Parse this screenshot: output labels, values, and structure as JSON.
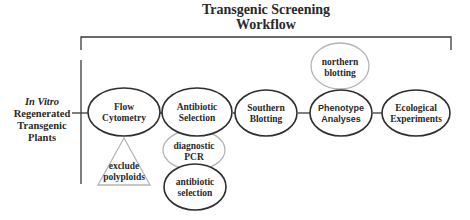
{
  "title": {
    "line1": "Transgenic Screening",
    "line2": "Workflow"
  },
  "source": {
    "line1": "In Vitro",
    "line2": "Regenerated",
    "line3": "Transgenic",
    "line4": "Plants"
  },
  "main_steps": [
    {
      "line1": "Flow",
      "line2": "Cytometry",
      "shape": "ellipse",
      "style": "dark"
    },
    {
      "line1": "Antibiotic",
      "line2": "Selection",
      "shape": "ellipse",
      "style": "dark"
    },
    {
      "line1": "Southern",
      "line2": "Blotting",
      "shape": "ellipse",
      "style": "dark"
    },
    {
      "line1": "Phenotype",
      "line2": "Analyses",
      "shape": "ellipse",
      "style": "dark"
    },
    {
      "line1": "Ecological",
      "line2": "Experiments",
      "shape": "ellipse",
      "style": "dark"
    }
  ],
  "sub_steps": {
    "exclude_polyploids": {
      "line1": "exclude",
      "line2": "polyploids",
      "shape": "triangle",
      "style": "light",
      "parent": "Flow Cytometry"
    },
    "diagnostic_pcr": {
      "line1": "diagnostic",
      "line2": "PCR",
      "shape": "ellipse",
      "style": "light",
      "parent": "Antibiotic Selection"
    },
    "antibiotic_selection_sub": {
      "line1": "antibiotic",
      "line2": "selection",
      "shape": "ellipse",
      "style": "dark",
      "parent": "Antibiotic Selection"
    },
    "northern_blotting": {
      "line1": "northern",
      "line2": "blotting",
      "shape": "ellipse",
      "style": "light",
      "parent": "Phenotype Analyses"
    }
  },
  "colors": {
    "dark_stroke": "#2f2f2f",
    "light_stroke": "#b5b5b5",
    "text": "#2a2a2a",
    "background": "#ffffff"
  }
}
